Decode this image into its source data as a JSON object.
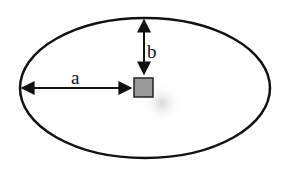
{
  "diagram": {
    "labels": {
      "a": "a",
      "b": "b"
    },
    "ellipse": {
      "cx": 145,
      "cy": 88,
      "rx": 125,
      "ry": 70,
      "stroke": "#111111"
    },
    "square": {
      "x": 134,
      "y": 77,
      "size": 19,
      "fill": "#9a9a9a",
      "stroke": "#222222"
    },
    "colors": {
      "line": "#111111",
      "shadow": "#cfcfcf"
    }
  }
}
